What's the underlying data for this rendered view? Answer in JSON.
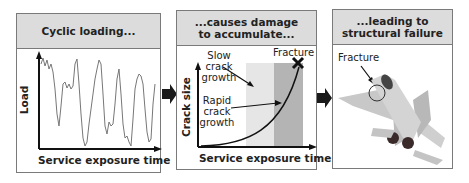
{
  "panels": [
    {
      "title": "Cyclic loading...",
      "x_label": "Service exposure time",
      "y_label": "Load"
    },
    {
      "title_line1": "...causes damage",
      "title_line2": "to accumulate...",
      "x_label": "Service exposure time",
      "y_label": "Crack size",
      "annotations": {
        "slow_line1": "Slow",
        "slow_line2": "crack",
        "slow_line3": "growth",
        "rapid_line1": "Rapid",
        "rapid_line2": "crack",
        "rapid_line3": "growth",
        "fracture": "Fracture"
      }
    },
    {
      "title_line1": "...leading to",
      "title_line2": "structural failure",
      "annotation": "Fracture"
    }
  ],
  "colors": {
    "header_bg": "#dcdcdc",
    "slow_band": "#e6e6e6",
    "rapid_band": "#b4b4b4",
    "arrow": "#1a1a1a"
  }
}
